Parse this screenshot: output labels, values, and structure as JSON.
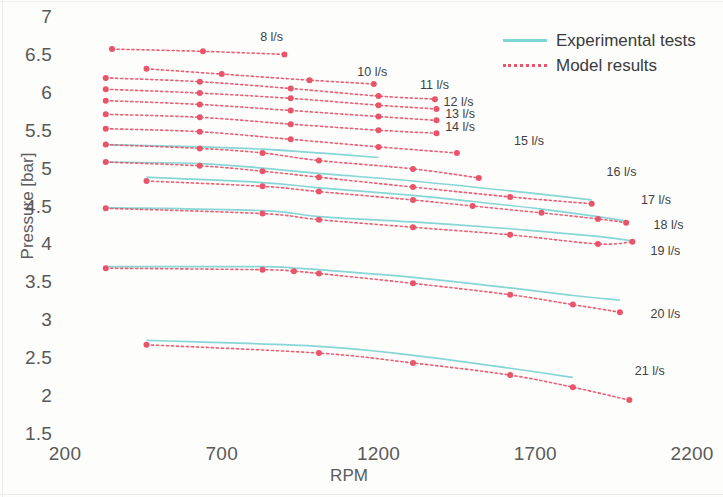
{
  "chart_data": {
    "type": "line",
    "title": "",
    "xlabel": "RPM",
    "ylabel": "Pressure [bar]",
    "xlim": [
      200,
      2200
    ],
    "ylim": [
      1.5,
      7
    ],
    "xticks": [
      200,
      700,
      1200,
      1700,
      2200
    ],
    "yticks": [
      1.5,
      2,
      2.5,
      3,
      3.5,
      4,
      4.5,
      5,
      5.5,
      6,
      6.5,
      7
    ],
    "grid": false,
    "legend_position": "top-right",
    "legend": [
      {
        "name": "Experimental tests",
        "style": "solid",
        "color": "#7fd4d4"
      },
      {
        "name": "Model results",
        "style": "dotted",
        "color": "#e8566d"
      }
    ],
    "annotations": [
      {
        "text": "8 l/s",
        "x": 880,
        "y": 6.73
      },
      {
        "text": "10 l/s",
        "x": 1190,
        "y": 6.28
      },
      {
        "text": "11 l/s",
        "x": 1390,
        "y": 6.1
      },
      {
        "text": "12 l/s",
        "x": 1465,
        "y": 5.88
      },
      {
        "text": "13 l/s",
        "x": 1470,
        "y": 5.72
      },
      {
        "text": "14 l/s",
        "x": 1470,
        "y": 5.55
      },
      {
        "text": "15 l/s",
        "x": 1690,
        "y": 5.37
      },
      {
        "text": "16 l/s",
        "x": 1985,
        "y": 4.95
      },
      {
        "text": "17 l/s",
        "x": 2095,
        "y": 4.58
      },
      {
        "text": "18 l/s",
        "x": 2135,
        "y": 4.26
      },
      {
        "text": "19 l/s",
        "x": 2125,
        "y": 3.92
      },
      {
        "text": "20 l/s",
        "x": 2125,
        "y": 3.08
      },
      {
        "text": "21 l/s",
        "x": 2075,
        "y": 2.33
      }
    ],
    "series": [
      {
        "name": "8 l/s",
        "experimental": {
          "x": [],
          "y": []
        },
        "model": {
          "x": [
            350,
            640,
            900
          ],
          "y": [
            6.59,
            6.56,
            6.52
          ]
        }
      },
      {
        "name": "9 l/s",
        "experimental": {
          "x": [],
          "y": []
        },
        "model": {
          "x": [
            460,
            700,
            980,
            1185
          ],
          "y": [
            6.33,
            6.26,
            6.18,
            6.13
          ]
        }
      },
      {
        "name": "10 l/s",
        "experimental": {
          "x": [],
          "y": []
        },
        "model": {
          "x": [
            330,
            630,
            920,
            1200,
            1380
          ],
          "y": [
            6.21,
            6.16,
            6.07,
            5.97,
            5.93
          ]
        }
      },
      {
        "name": "11 l/s",
        "experimental": {
          "x": [],
          "y": []
        },
        "model": {
          "x": [
            330,
            630,
            920,
            1200,
            1385
          ],
          "y": [
            6.06,
            6.01,
            5.94,
            5.85,
            5.8
          ]
        }
      },
      {
        "name": "12 l/s",
        "experimental": {
          "x": [],
          "y": []
        },
        "model": {
          "x": [
            330,
            630,
            920,
            1200,
            1385
          ],
          "y": [
            5.91,
            5.86,
            5.78,
            5.7,
            5.65
          ]
        }
      },
      {
        "name": "13 l/s",
        "experimental": {
          "x": [],
          "y": []
        },
        "model": {
          "x": [
            330,
            630,
            920,
            1200,
            1385
          ],
          "y": [
            5.73,
            5.69,
            5.6,
            5.52,
            5.48
          ]
        }
      },
      {
        "name": "14 l/s",
        "experimental": {
          "x": [],
          "y": []
        },
        "model": {
          "x": [
            330,
            630,
            920,
            1200,
            1450
          ],
          "y": [
            5.54,
            5.5,
            5.4,
            5.3,
            5.22
          ]
        }
      },
      {
        "name": "15 l/s",
        "experimental": {
          "x": [
            330,
            630,
            830,
            1010,
            1200
          ],
          "y": [
            5.33,
            5.3,
            5.27,
            5.22,
            5.16
          ]
        },
        "model": {
          "x": [
            330,
            630,
            830,
            1010,
            1310,
            1520
          ],
          "y": [
            5.33,
            5.28,
            5.22,
            5.12,
            5.01,
            4.89
          ]
        }
      },
      {
        "name": "16 l/s",
        "experimental": {
          "x": [
            330,
            630,
            830,
            1010,
            1310,
            1620,
            1880
          ],
          "y": [
            5.1,
            5.08,
            5.02,
            4.95,
            4.85,
            4.72,
            4.6
          ]
        },
        "model": {
          "x": [
            330,
            630,
            830,
            1010,
            1310,
            1620,
            1880
          ],
          "y": [
            5.1,
            5.05,
            4.98,
            4.9,
            4.77,
            4.64,
            4.55
          ]
        }
      },
      {
        "name": "17 l/s",
        "experimental": {
          "x": [
            460,
            830,
            1010,
            1310,
            1500,
            1720,
            1900,
            1990
          ],
          "y": [
            4.9,
            4.83,
            4.76,
            4.66,
            4.58,
            4.48,
            4.38,
            4.32
          ]
        },
        "model": {
          "x": [
            460,
            830,
            1010,
            1310,
            1500,
            1720,
            1900,
            1990
          ],
          "y": [
            4.85,
            4.78,
            4.71,
            4.6,
            4.52,
            4.43,
            4.35,
            4.3
          ]
        }
      },
      {
        "name": "18 l/s",
        "experimental": {
          "x": [
            330,
            830,
            1010,
            1310,
            1620,
            1900,
            2010
          ],
          "y": [
            4.5,
            4.46,
            4.38,
            4.31,
            4.22,
            4.12,
            4.06
          ]
        },
        "model": {
          "x": [
            330,
            830,
            1010,
            1310,
            1620,
            1900,
            2010
          ],
          "y": [
            4.49,
            4.42,
            4.34,
            4.24,
            4.14,
            4.02,
            4.05
          ]
        }
      },
      {
        "name": "19 l/s",
        "experimental": {
          "x": [
            330,
            830,
            930,
            1010,
            1310,
            1620,
            1820,
            1970
          ],
          "y": [
            3.72,
            3.72,
            3.7,
            3.68,
            3.58,
            3.44,
            3.34,
            3.28
          ]
        },
        "model": {
          "x": [
            330,
            830,
            930,
            1010,
            1310,
            1620,
            1820,
            1970
          ],
          "y": [
            3.7,
            3.68,
            3.66,
            3.63,
            3.5,
            3.35,
            3.22,
            3.12
          ]
        }
      },
      {
        "name": "20 l/s",
        "experimental": {
          "x": [
            460,
            1010,
            1310,
            1620,
            1820
          ],
          "y": [
            2.75,
            2.67,
            2.55,
            2.38,
            2.26
          ]
        },
        "model": {
          "x": [
            460,
            1010,
            1310,
            1620,
            1820,
            2000
          ],
          "y": [
            2.69,
            2.58,
            2.45,
            2.29,
            2.13,
            1.96
          ]
        }
      },
      {
        "name": "21 l/s",
        "experimental": {
          "x": [],
          "y": []
        },
        "model": {
          "x": [],
          "y": []
        }
      }
    ]
  },
  "axis": {
    "yticks_text": [
      "7",
      "6.5",
      "6",
      "5.5",
      "5",
      "4.5",
      "4",
      "3.5",
      "3",
      "2.5",
      "2",
      "1.5"
    ],
    "xticks_text": [
      "200",
      "700",
      "1200",
      "1700",
      "2200"
    ],
    "ylabel_text": "Pressure [bar]",
    "xlabel_text": "RPM"
  },
  "legend": {
    "experimental_label": "Experimental tests",
    "model_label": "Model results"
  },
  "colors": {
    "experimental": "#7fd4d4",
    "model": "#e8566d",
    "marker": "#e8556b",
    "text": "#595959",
    "background": "#fdfdfc"
  }
}
